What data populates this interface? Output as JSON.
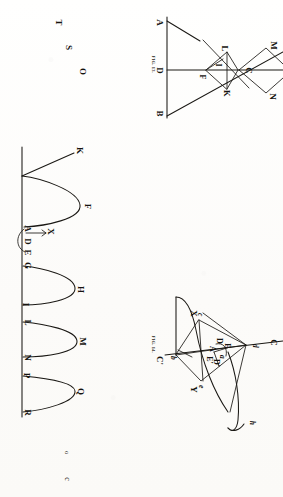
{
  "page": {
    "kind": "scanned-book-plate",
    "orientation": "rotated-90-clockwise",
    "background_color": "#fdfdfc",
    "ink_color": "#1a1814"
  },
  "stray_letters": {
    "title": "isolated-letters-left-margin",
    "items": [
      {
        "text": "T",
        "x": 59,
        "y": 22
      },
      {
        "text": "S",
        "x": 70,
        "y": 47
      },
      {
        "text": "O",
        "x": 83,
        "y": 71
      },
      {
        "text": "o",
        "x": 68,
        "y": 453
      },
      {
        "text": "c",
        "x": 68,
        "y": 479
      }
    ]
  },
  "fig13": {
    "caption": "FIG. 13.",
    "labels": [
      {
        "text": "A",
        "x": 157,
        "y": 22
      },
      {
        "text": "D",
        "x": 157,
        "y": 70
      },
      {
        "text": "B",
        "x": 157,
        "y": 112
      },
      {
        "text": "F",
        "x": 203,
        "y": 76
      },
      {
        "text": "I",
        "x": 217,
        "y": 64
      },
      {
        "text": "L",
        "x": 224,
        "y": 48
      },
      {
        "text": "K",
        "x": 225,
        "y": 92
      },
      {
        "text": "C",
        "x": 247,
        "y": 70
      },
      {
        "text": "M",
        "x": 272,
        "y": 45
      },
      {
        "text": "N",
        "x": 272,
        "y": 95
      }
    ]
  },
  "wave": {
    "title": "sinusoidal-wave-diagram",
    "labels": [
      {
        "text": "K",
        "x": 79,
        "y": 150
      },
      {
        "text": "F",
        "x": 88,
        "y": 205
      },
      {
        "text": "A",
        "x": 26,
        "y": 228
      },
      {
        "text": "X",
        "x": 49,
        "y": 231
      },
      {
        "text": "D",
        "x": 26,
        "y": 241
      },
      {
        "text": "E",
        "x": 26,
        "y": 251
      },
      {
        "text": "G",
        "x": 26,
        "y": 264
      },
      {
        "text": "H",
        "x": 80,
        "y": 288
      },
      {
        "text": "I",
        "x": 25,
        "y": 303
      },
      {
        "text": "L",
        "x": 26,
        "y": 321
      },
      {
        "text": "M",
        "x": 81,
        "y": 340
      },
      {
        "text": "N",
        "x": 26,
        "y": 356
      },
      {
        "text": "P",
        "x": 26,
        "y": 374
      },
      {
        "text": "Q",
        "x": 80,
        "y": 390
      },
      {
        "text": "R",
        "x": 26,
        "y": 411
      }
    ]
  },
  "fig14": {
    "caption": "FIG. 14.",
    "labels": [
      {
        "text": "C'",
        "x": 157,
        "y": 359
      },
      {
        "text": "C",
        "x": 272,
        "y": 342
      },
      {
        "text": "X",
        "x": 192,
        "y": 312
      },
      {
        "text": "Y",
        "x": 192,
        "y": 388
      },
      {
        "text": "A",
        "x": 211,
        "y": 348
      },
      {
        "text": "D",
        "x": 218,
        "y": 340
      },
      {
        "text": "E",
        "x": 226,
        "y": 345
      },
      {
        "text": "D'",
        "x": 215,
        "y": 362
      },
      {
        "text": "E'",
        "x": 208,
        "y": 359
      },
      {
        "text": "a",
        "x": 222,
        "y": 356
      },
      {
        "text": "b",
        "x": 173,
        "y": 357
      },
      {
        "text": "c",
        "x": 201,
        "y": 313
      },
      {
        "text": "d",
        "x": 255,
        "y": 345
      },
      {
        "text": "e",
        "x": 202,
        "y": 385
      },
      {
        "text": "h",
        "x": 252,
        "y": 422
      }
    ]
  }
}
